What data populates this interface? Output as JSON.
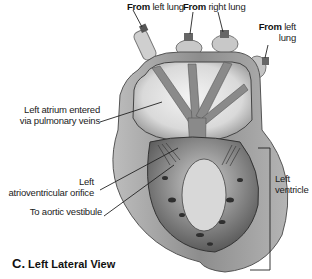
{
  "diagram": {
    "title": "Left Lateral View",
    "panel_letter": "C.",
    "labels": {
      "from_left_lung_1": {
        "bold": "From",
        "text": " left lung"
      },
      "from_right_lung": {
        "bold": "From",
        "text": " right lung"
      },
      "from_left_lung_2": {
        "bold": "From",
        "text": " left",
        "line2": "lung"
      },
      "left_atrium": {
        "line1": "Left atrium entered",
        "line2": "via pulmonary veins"
      },
      "av_orifice": {
        "line1": "Left",
        "line2": "atrioventricular orifice"
      },
      "aortic_vestibule": {
        "line1": "To aortic vestibule"
      },
      "left_ventricle": {
        "line1": "Left",
        "line2": "ventricle"
      }
    },
    "colors": {
      "background": "#ffffff",
      "wall": "#9a9a9a",
      "wall_dark": "#6e6e6e",
      "chamber": "#e6e6e6",
      "septum": "#8c8c8c",
      "trabeculae": "#3c3c3c",
      "leader": "#222222"
    }
  }
}
